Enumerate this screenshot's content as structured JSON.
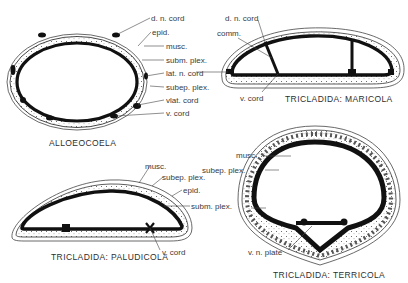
{
  "figure": {
    "panels": [
      {
        "id": "alloeocoela",
        "title": "ALLOEOCOELA",
        "labels": [
          "d. n. cord",
          "epid.",
          "musc.",
          "subm. plex.",
          "lat. n. cord",
          "subep. plex.",
          "vlat. cord",
          "v. cord"
        ]
      },
      {
        "id": "maricola",
        "title": "TRICLADIDA:  MARICOLA",
        "labels": [
          "d. n. cord",
          "comm.",
          "v. cord"
        ]
      },
      {
        "id": "paludicola",
        "title": "TRICLADIDA:  PALUDICOLA",
        "labels": [
          "musc.",
          "subep. plex.",
          "epid.",
          "subm. plex.",
          "v. cord"
        ]
      },
      {
        "id": "terricola",
        "title": "TRICLADIDA:  TERRICOLA",
        "labels": [
          "musc.",
          "subep. plex.",
          "v. n. plate"
        ]
      }
    ]
  }
}
